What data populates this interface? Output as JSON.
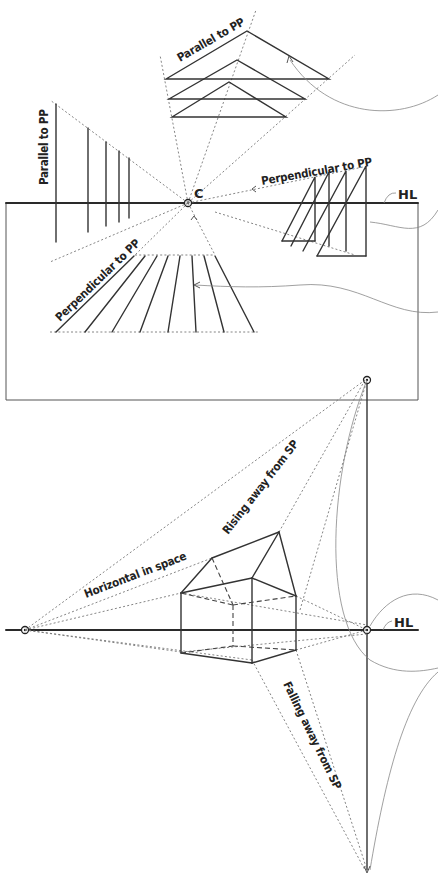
{
  "figure": {
    "top_panel": {
      "center_label": "C",
      "horizon_label": "HL",
      "labels": {
        "parallel_top": "Parallel to PP",
        "parallel_left": "Parallel to PP",
        "perpendicular_right": "Perpendicular to PP",
        "perpendicular_bottom": "Perpendicular to PP"
      }
    },
    "bottom_panel": {
      "horizon_label": "HL",
      "labels": {
        "horizontal": "Horizontal in space",
        "rising": "Rising away from SP",
        "falling": "Falling away from SP"
      }
    }
  },
  "colors": {
    "ink": "#2a2a2a",
    "construction": "#777777",
    "background": "#ffffff"
  }
}
